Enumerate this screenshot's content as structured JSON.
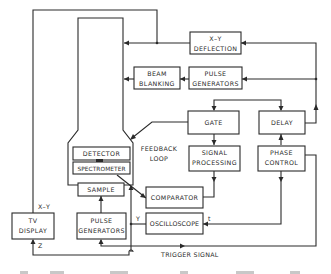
{
  "diagram": {
    "blocks": {
      "xy_deflection": [
        "X–Y",
        "DEFLECTION"
      ],
      "beam_blanking": [
        "BEAM",
        "BLANKING"
      ],
      "pulse_generators_top": [
        "PULSE",
        "GENERATORS"
      ],
      "gate": [
        "GATE"
      ],
      "delay": [
        "DELAY"
      ],
      "signal_processing": [
        "SIGNAL",
        "PROCESSING"
      ],
      "phase_control": [
        "PHASE",
        "CONTROL"
      ],
      "detector": [
        "DETECTOR"
      ],
      "spectrometer": [
        "SPECTROMETER"
      ],
      "sample": [
        "SAMPLE"
      ],
      "comparator": [
        "COMPARATOR"
      ],
      "oscilloscope": [
        "OSCILLOSCOPE"
      ],
      "tv_display": [
        "TV",
        "DISPLAY"
      ],
      "pulse_generators_bottom": [
        "PULSE",
        "GENERATORS"
      ]
    },
    "annotations": {
      "feedback_loop": [
        "FEEDBACK",
        "LOOP"
      ],
      "trigger_signal": "TRIGGER  SIGNAL",
      "tv_xy_input": "X–Y",
      "tv_z_input": "Z",
      "osc_y_input": "Y",
      "osc_t_input": "t"
    },
    "caption_partial": "(caption cut off at bottom edge)"
  }
}
